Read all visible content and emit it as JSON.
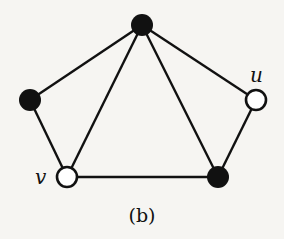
{
  "figure": {
    "caption": "(b)",
    "background": "#f6f5f2",
    "stroke_color": "#111111",
    "nodes": [
      {
        "id": "top",
        "x": 142,
        "y": 25,
        "filled": true,
        "label": ""
      },
      {
        "id": "left",
        "x": 30,
        "y": 100,
        "filled": true,
        "label": ""
      },
      {
        "id": "u",
        "x": 256,
        "y": 100,
        "filled": false,
        "label": "u"
      },
      {
        "id": "v",
        "x": 67,
        "y": 177,
        "filled": false,
        "label": "v"
      },
      {
        "id": "bottom-right",
        "x": 218,
        "y": 177,
        "filled": true,
        "label": ""
      }
    ],
    "edges": [
      [
        "top",
        "left"
      ],
      [
        "top",
        "v"
      ],
      [
        "top",
        "bottom-right"
      ],
      [
        "top",
        "u"
      ],
      [
        "left",
        "v"
      ],
      [
        "v",
        "bottom-right"
      ],
      [
        "bottom-right",
        "u"
      ]
    ],
    "labels": {
      "u": "u",
      "v": "v"
    }
  }
}
